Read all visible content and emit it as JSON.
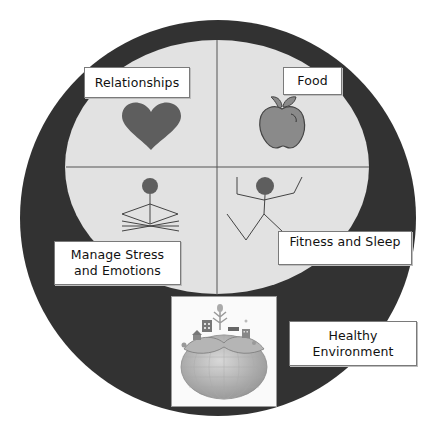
{
  "diagram": {
    "title": "",
    "colors": {
      "outer_ring": "#323232",
      "inner_field": "#e2e2e2",
      "divider": "#555555",
      "icon_fill": "#5e5e5e",
      "apple_fill": "#8a8a8a",
      "label_bg": "#ffffff",
      "label_border": "#7a7a7a"
    },
    "quadrants": [
      {
        "id": "relationships",
        "label_lines": [
          "Relationships"
        ],
        "icon": "heart-icon"
      },
      {
        "id": "food",
        "label_lines": [
          "Food"
        ],
        "icon": "apple-icon"
      },
      {
        "id": "stress",
        "label_lines": [
          "Manage Stress",
          "and Emotions"
        ],
        "icon": "meditating-figure-icon"
      },
      {
        "id": "fitness",
        "label_lines": [
          "Fitness and Sleep"
        ],
        "icon": "exercising-figure-icon"
      }
    ],
    "base": {
      "label_lines": [
        "Healthy",
        "Environment"
      ],
      "icon": "earth-with-city-icon"
    }
  }
}
